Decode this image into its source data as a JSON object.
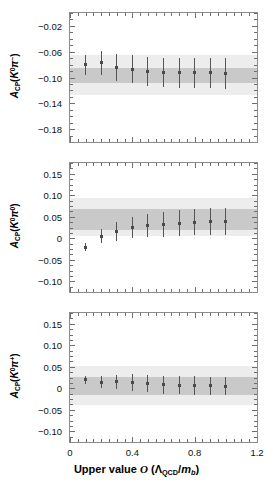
{
  "figure": {
    "type": "multi-panel-errorbar-plot",
    "panel_count": 3
  },
  "axis": {
    "x_title_prefix": "Upper value",
    "x_title_symbol": "ᵊO",
    "x_title_paren_open": "(",
    "x_title_lambda": "Λ",
    "x_title_lambda_sub": "QCD",
    "x_title_slash": "/",
    "x_title_m": "m",
    "x_title_m_sub": "b",
    "x_title_paren_close": ")",
    "x_title_full": "Upper value O (ΛQCD/mb)",
    "x_ticklabels": [
      "0",
      "0.4",
      "0.8",
      "1.2"
    ],
    "x_tickvalues": [
      0,
      0.4,
      0.8,
      1.2
    ],
    "x_min": 0,
    "x_max": 1.2,
    "x_minor_step": 0.05
  },
  "colors": {
    "band_outer": "#ededed",
    "band_inner": "#c9c9c9",
    "marker": "#4a4a4a",
    "errorbar": "#555555",
    "frame": "#8b8b8b",
    "text": "#111111"
  },
  "chart_data": [
    {
      "type": "scatter",
      "panel_index": 0,
      "title": "",
      "xlabel": "",
      "ylabel": "A_CP(K0 pi-)",
      "ylabel_parts": {
        "a": "A",
        "cp": "CP",
        "open": "(",
        "k": "K",
        "k_sup": "0",
        "pi": "π",
        "pi_sup": "−",
        "close": ")"
      },
      "ylim": [
        -0.2,
        0.0
      ],
      "yticks": [
        -0.02,
        -0.06,
        -0.1,
        -0.14,
        -0.18
      ],
      "yticklabels": [
        "−0.02",
        "−0.06",
        "−0.10",
        "−0.14",
        "−0.18"
      ],
      "y_minor_step": 0.01,
      "grid": false,
      "legend": "none",
      "bands": [
        {
          "name": "outer",
          "low": -0.1275,
          "high": -0.0655
        },
        {
          "name": "inner",
          "low": -0.1085,
          "high": -0.0855
        }
      ],
      "x": [
        0.1,
        0.2,
        0.3,
        0.4,
        0.5,
        0.6,
        0.7,
        0.8,
        0.9,
        1.0
      ],
      "values": [
        -0.08,
        -0.0775,
        -0.0845,
        -0.087,
        -0.091,
        -0.0925,
        -0.0925,
        -0.093,
        -0.093,
        -0.0935
      ],
      "yerr": [
        0.0155,
        0.018,
        0.0205,
        0.0215,
        0.0225,
        0.023,
        0.0235,
        0.0235,
        0.024,
        0.024
      ]
    },
    {
      "type": "scatter",
      "panel_index": 1,
      "title": "",
      "xlabel": "",
      "ylabel": "A_CP(K0 pi0)",
      "ylabel_parts": {
        "a": "A",
        "cp": "CP",
        "open": "(",
        "k": "K",
        "k_sup": "0",
        "pi": "π",
        "pi_sup": "0",
        "close": ")"
      },
      "ylim": [
        -0.125,
        0.175
      ],
      "yticks": [
        0.15,
        0.1,
        0.05,
        0,
        -0.05,
        -0.1
      ],
      "yticklabels": [
        "0.15",
        "0.10",
        "0.05",
        "0",
        "−0.05",
        "−0.10"
      ],
      "y_minor_step": 0.0125,
      "grid": false,
      "legend": "none",
      "bands": [
        {
          "name": "outer",
          "low": 0.0055,
          "high": 0.093
        },
        {
          "name": "inner",
          "low": 0.0195,
          "high": 0.067
        }
      ],
      "x": [
        0.1,
        0.2,
        0.3,
        0.4,
        0.5,
        0.6,
        0.7,
        0.8,
        0.9,
        1.0
      ],
      "values": [
        -0.0205,
        0.0045,
        0.016,
        0.0245,
        0.0295,
        0.033,
        0.035,
        0.037,
        0.0385,
        0.039
      ],
      "yerr": [
        0.009,
        0.016,
        0.0215,
        0.025,
        0.0275,
        0.029,
        0.03,
        0.0305,
        0.031,
        0.031
      ]
    },
    {
      "type": "scatter",
      "panel_index": 2,
      "title": "",
      "xlabel": "Upper value O (ΛQCD/mb)",
      "ylabel": "A_CP(K0 pi+)",
      "ylabel_parts": {
        "a": "A",
        "cp": "CP",
        "open": "(",
        "k": "K",
        "k_sup": "0",
        "pi": "π",
        "pi_sup": "+",
        "close": ")"
      },
      "ylim": [
        -0.125,
        0.175
      ],
      "yticks": [
        0.15,
        0.1,
        0.05,
        0,
        -0.05,
        -0.1
      ],
      "yticklabels": [
        "0.15",
        "0.10",
        "0.05",
        "0",
        "−0.05",
        "−0.10"
      ],
      "y_minor_step": 0.0125,
      "grid": false,
      "legend": "none",
      "bands": [
        {
          "name": "outer",
          "low": -0.04,
          "high": 0.051
        },
        {
          "name": "inner",
          "low": -0.0165,
          "high": 0.0265
        }
      ],
      "x": [
        0.1,
        0.2,
        0.3,
        0.4,
        0.5,
        0.6,
        0.7,
        0.8,
        0.9,
        1.0
      ],
      "values": [
        0.02,
        0.0145,
        0.015,
        0.013,
        0.0105,
        0.008,
        0.007,
        0.0065,
        0.0055,
        0.005
      ],
      "yerr": [
        0.009,
        0.014,
        0.0165,
        0.019,
        0.02,
        0.0205,
        0.021,
        0.0215,
        0.0215,
        0.0215
      ]
    }
  ]
}
